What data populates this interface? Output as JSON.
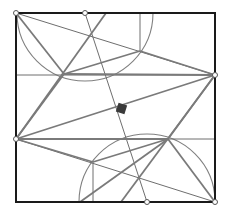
{
  "diagram": {
    "type": "geometric-construction",
    "frame": {
      "x1": 16,
      "y1": 13,
      "x2": 215,
      "y2": 202,
      "color": "#1a1a1a",
      "width": 2
    },
    "colors": {
      "thick_line": "#7a7a7a",
      "thin_line": "#6e6e6e",
      "arc": "#808080",
      "dot_fill": "#ffffff",
      "dot_stroke": "#555555",
      "marker": "#3a3a3a"
    },
    "points": [
      {
        "id": "A",
        "x": 16,
        "y": 13
      },
      {
        "id": "B",
        "x": 85,
        "y": 13
      },
      {
        "id": "C",
        "x": 215,
        "y": 75
      },
      {
        "id": "D",
        "x": 16,
        "y": 139
      },
      {
        "id": "E",
        "x": 147,
        "y": 202
      },
      {
        "id": "F",
        "x": 215,
        "y": 202
      }
    ],
    "intersections": [
      {
        "id": "P1",
        "x": 64,
        "y": 74
      },
      {
        "id": "P2",
        "x": 93,
        "y": 36
      },
      {
        "id": "P3",
        "x": 140,
        "y": 51
      },
      {
        "id": "P4",
        "x": 168,
        "y": 139
      },
      {
        "id": "P5",
        "x": 93,
        "y": 162
      },
      {
        "id": "P6",
        "x": 140,
        "y": 177
      }
    ],
    "thin_lines": [
      {
        "x1": 16,
        "y1": 75,
        "x2": 215,
        "y2": 75
      },
      {
        "x1": 16,
        "y1": 139,
        "x2": 215,
        "y2": 139
      },
      {
        "x1": 16,
        "y1": 13,
        "x2": 215,
        "y2": 75
      },
      {
        "x1": 16,
        "y1": 139,
        "x2": 215,
        "y2": 202
      },
      {
        "x1": 85,
        "y1": 13,
        "x2": 147,
        "y2": 202
      },
      {
        "x1": 140,
        "y1": 13,
        "x2": 140,
        "y2": 51
      },
      {
        "x1": 93,
        "y1": 162,
        "x2": 93,
        "y2": 202
      }
    ],
    "thick_lines": [
      {
        "x1": 16,
        "y1": 13,
        "x2": 64,
        "y2": 74
      },
      {
        "x1": 64,
        "y1": 74,
        "x2": 215,
        "y2": 75
      },
      {
        "x1": 64,
        "y1": 74,
        "x2": 140,
        "y2": 51
      },
      {
        "x1": 140,
        "y1": 51,
        "x2": 215,
        "y2": 75
      },
      {
        "x1": 64,
        "y1": 74,
        "x2": 16,
        "y2": 139
      },
      {
        "x1": 215,
        "y1": 75,
        "x2": 16,
        "y2": 139
      },
      {
        "x1": 16,
        "y1": 139,
        "x2": 168,
        "y2": 139
      },
      {
        "x1": 16,
        "y1": 139,
        "x2": 93,
        "y2": 162
      },
      {
        "x1": 93,
        "y1": 162,
        "x2": 168,
        "y2": 139
      },
      {
        "x1": 168,
        "y1": 139,
        "x2": 215,
        "y2": 202
      },
      {
        "x1": 168,
        "y1": 139,
        "x2": 215,
        "y2": 75
      },
      {
        "x1": 106,
        "y1": 13,
        "x2": 16,
        "y2": 139
      },
      {
        "x1": 215,
        "y1": 75,
        "x2": 121,
        "y2": 202
      },
      {
        "x1": 168,
        "y1": 139,
        "x2": 80,
        "y2": 202
      }
    ],
    "arcs": [
      {
        "cx": 85,
        "cy": 13,
        "r": 68,
        "from": 180,
        "to": 0
      },
      {
        "cx": 147,
        "cy": 202,
        "r": 68,
        "from": 180,
        "to": 360
      }
    ],
    "marker": {
      "x": 117,
      "y": 104,
      "size": 9,
      "angle": 18
    }
  }
}
